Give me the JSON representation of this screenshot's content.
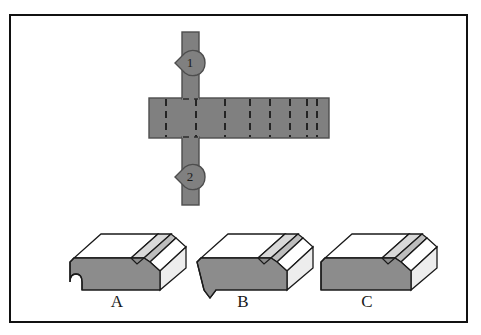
{
  "figure": {
    "type": "engineering-section-view-multiple-choice",
    "border_color": "#111111",
    "background": "#ffffff",
    "solid_fill": "#808080",
    "solid_stroke": "#4a4a4a",
    "hidden_line_color": "#2b2b2b",
    "top_face_fill": "#ffffff",
    "right_face_fill": "#e6e6e6",
    "front_face_fill": "#8c8c8c",
    "outline_color": "#1a1a1a"
  },
  "cutting_plane": {
    "name": "cutting-plane-line",
    "vertical_bar": {
      "x": 182,
      "y": 32,
      "width": 17,
      "height": 173
    },
    "horizontal_bar": {
      "x": 149,
      "y": 98,
      "width": 180,
      "height": 40
    },
    "hidden_lines_x": [
      166,
      196,
      225,
      250,
      270,
      290,
      307,
      317
    ],
    "markers": [
      {
        "label": "1",
        "position": "top",
        "cx": 190,
        "cy": 63,
        "arrow_direction": "left"
      },
      {
        "label": "2",
        "position": "bottom",
        "cx": 190,
        "cy": 177,
        "arrow_direction": "left"
      }
    ]
  },
  "options": [
    {
      "id": "A",
      "label": "A",
      "label_x": 117,
      "label_y": 294,
      "description": "block with angled groove and rounded concave notch on front face"
    },
    {
      "id": "B",
      "label": "B",
      "label_x": 243,
      "label_y": 294,
      "description": "block with angled groove and pointed V notch on front face"
    },
    {
      "id": "C",
      "label": "C",
      "label_x": 367,
      "label_y": 294,
      "description": "block with angled groove and plain straight front face"
    }
  ]
}
